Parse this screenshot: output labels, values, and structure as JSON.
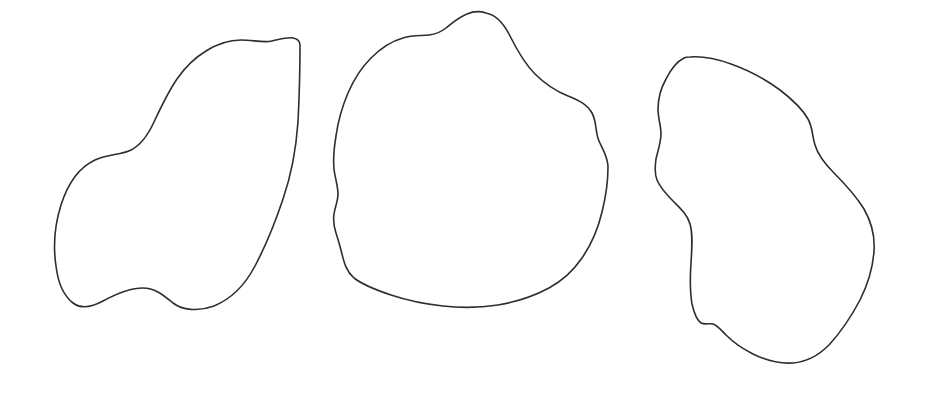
{
  "canvas": {
    "width": 926,
    "height": 406,
    "background_color": "#ffffff",
    "description": "Three hand-drawn closed blob outlines arranged left to right on a plain white background"
  },
  "style": {
    "stroke_color": "#2e2e2e",
    "stroke_width": 1.6,
    "fill": "none"
  },
  "shapes": [
    {
      "id": "blob-left",
      "name": "left-blob-outline",
      "order": 1,
      "bounds": {
        "x": 55,
        "y": 37,
        "width": 248,
        "height": 273
      },
      "path": "M 300 45 C 300 78 299 102 298 122 C 296 150 291 176 283 199 C 274 226 264 249 255 266 C 245 285 231 299 214 306 C 198 312 182 310 173 303 C 163 295 155 288 143 288 C 130 288 116 294 103 301 C 92 307 81 309 73 303 C 64 296 58 283 56 266 C 53 246 55 224 61 205 C 68 183 80 167 95 160 C 108 154 121 155 131 150 C 141 145 148 135 154 122 C 161 107 168 92 177 79 C 186 66 196 57 206 51 C 217 44 229 40 241 40 C 253 40 263 43 272 41 C 281 39 288 37 293 38 C 298 39 300 41 300 45 Z"
    },
    {
      "id": "blob-middle",
      "name": "middle-blob-outline",
      "order": 2,
      "bounds": {
        "x": 333,
        "y": 12,
        "width": 276,
        "height": 296
      },
      "path": "M 486 13 C 497 15 504 24 510 36 C 517 50 525 64 535 74 C 546 85 558 92 568 96 C 578 100 587 104 592 113 C 597 122 595 132 599 141 C 603 150 608 157 608 167 C 608 180 606 196 602 212 C 598 229 591 245 582 258 C 573 271 562 281 549 288 C 534 296 516 302 498 305 C 479 308 460 308 443 306 C 424 304 406 300 391 295 C 376 290 363 285 354 278 C 346 271 344 262 342 254 C 340 246 338 239 336 233 C 334 227 333 221 334 214 C 335 207 338 201 338 194 C 338 186 335 178 334 169 C 333 159 334 148 336 136 C 338 122 342 107 348 93 C 354 79 362 67 371 58 C 381 48 392 41 403 38 C 413 35 422 36 429 35 C 436 34 441 32 446 28 C 452 23 459 17 467 14 C 474 11 480 11 486 13 Z"
    },
    {
      "id": "blob-right",
      "name": "right-blob-outline",
      "order": 3,
      "bounds": {
        "x": 655,
        "y": 56,
        "width": 219,
        "height": 308
      },
      "path": "M 690 57 C 703 56 717 59 731 64 C 748 70 765 79 780 90 C 793 100 803 110 808 119 C 813 128 812 136 815 145 C 818 155 825 164 834 173 C 845 184 856 196 864 209 C 872 223 875 237 874 251 C 873 267 868 284 860 300 C 851 317 840 333 829 345 C 818 356 806 362 793 363 C 779 364 765 360 753 354 C 741 348 732 341 726 335 C 720 329 717 325 713 324 C 709 323 705 325 701 323 C 697 320 694 313 692 304 C 690 292 690 277 691 263 C 692 248 693 234 690 224 C 687 214 680 208 673 201 C 666 194 660 187 657 180 C 654 173 655 166 656 159 C 658 150 661 142 661 134 C 661 126 658 118 658 109 C 658 99 661 88 666 79 C 671 69 678 61 684 58 C 686 57 688 57 690 57 Z"
    }
  ]
}
